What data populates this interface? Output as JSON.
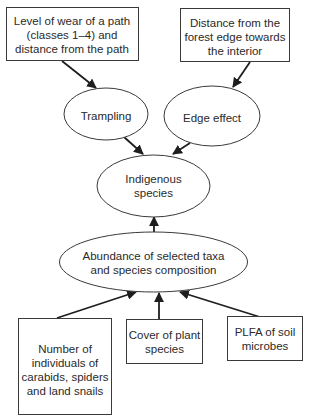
{
  "diagram": {
    "type": "flow/causal diagram",
    "nodes": {
      "wear": {
        "shape": "rectangle",
        "lines": [
          "Level of wear of a path",
          "(classes 1–4) and",
          "distance from the path"
        ]
      },
      "distance": {
        "shape": "rectangle",
        "lines": [
          "Distance from the",
          "forest edge towards",
          "the interior"
        ]
      },
      "trampling": {
        "shape": "ellipse",
        "lines": [
          "Trampling"
        ]
      },
      "edge_effect": {
        "shape": "ellipse",
        "lines": [
          "Edge effect"
        ]
      },
      "indigenous": {
        "shape": "ellipse",
        "lines": [
          "Indigenous",
          "species"
        ]
      },
      "abundance": {
        "shape": "ellipse",
        "lines": [
          "Abundance of selected taxa",
          "and species composition"
        ]
      },
      "individuals": {
        "shape": "rectangle",
        "lines": [
          "Number of",
          "individuals of",
          "carabids, spiders",
          "and land snails"
        ]
      },
      "cover": {
        "shape": "rectangle",
        "lines": [
          "Cover of plant",
          "species"
        ]
      },
      "plfa": {
        "shape": "rectangle",
        "lines": [
          "PLFA of soil",
          "microbes"
        ]
      }
    },
    "edges": [
      {
        "from": "Level of wear of a path (classes 1–4) and distance from the path",
        "to": "Trampling"
      },
      {
        "from": "Distance from the forest edge towards the interior",
        "to": "Edge effect"
      },
      {
        "from": "Trampling",
        "to": "Indigenous species"
      },
      {
        "from": "Edge effect",
        "to": "Indigenous species"
      },
      {
        "from": "Abundance of selected taxa and species composition",
        "to": "Indigenous species"
      },
      {
        "from": "Number of individuals of carabids, spiders and land snails",
        "to": "Abundance of selected taxa and species composition"
      },
      {
        "from": "Cover of plant species",
        "to": "Abundance of selected taxa and species composition"
      },
      {
        "from": "PLFA of soil microbes",
        "to": "Abundance of selected taxa and species composition"
      }
    ],
    "colors": {
      "background": "#ffffff",
      "stroke": "#3a3a3a",
      "text": "#2a2a2a"
    }
  }
}
